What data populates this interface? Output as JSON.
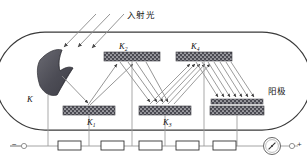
{
  "figure": {
    "type": "photomultiplier-tube-schematic",
    "title_cjk": "光电倍增管原理图",
    "labels": {
      "incident_light": "入射光",
      "anode": "阳极",
      "cathode": "K",
      "dynode1": "K",
      "dynode1_sub": "1",
      "dynode2": "K",
      "dynode2_sub": "2",
      "dynode3": "K",
      "dynode3_sub": "3",
      "dynode4": "K",
      "dynode4_sub": "4",
      "terminal_negative": "−",
      "terminal_positive": "+"
    },
    "colors": {
      "outline": "#3a3a3a",
      "electrode_fill": "#4a4a52",
      "electrode_dots": "#d8d8dc",
      "cathode_fill": "#55555d",
      "ray": "#8a8a8a",
      "wire": "#9a9a9a",
      "resistor_stroke": "#333333",
      "text": "#111111"
    },
    "counts": {
      "incident_rays": 3,
      "resistors": 5,
      "dynodes": 4,
      "tap_lines": 6
    },
    "components": {
      "galvanometer": "galvanometer-meter",
      "resistor": "resistor-box"
    }
  }
}
